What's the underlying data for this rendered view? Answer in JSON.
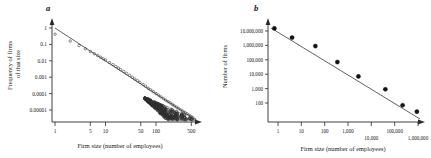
{
  "figure": {
    "panels": [
      {
        "letter": "a",
        "xlabel": "Firm size (number of employees)",
        "ylabel_line1": "Frequency of firms",
        "ylabel_line2": "of that size",
        "xticks": [
          "1",
          "5",
          "10",
          "50",
          "100",
          "500"
        ],
        "yticks": [
          "1",
          "0.1",
          "0.01",
          "0.001",
          "0.0001",
          "0.00001"
        ]
      },
      {
        "letter": "b",
        "xlabel": "Firm size (number of employees)",
        "ylabel": "Number of firms",
        "xticks": [
          "1",
          "10",
          "100",
          "1,000",
          "10,000",
          "100,000",
          "1,000,000"
        ],
        "yticks": [
          "10,000,000",
          "1,000,000",
          "100,000",
          "10,000",
          "1,000",
          "100"
        ]
      }
    ]
  },
  "chart_data": [
    {
      "type": "scatter",
      "title": "a",
      "xlabel": "Firm size (number of employees)",
      "ylabel": "Frequency of firms of that size",
      "xscale": "log",
      "yscale": "log",
      "xlim": [
        1,
        700
      ],
      "ylim": [
        1.5e-06,
        2
      ],
      "xticks": [
        1,
        5,
        10,
        50,
        100,
        500
      ],
      "xticklabels": [
        "1",
        "5",
        "10",
        "50",
        "100",
        "500"
      ],
      "yticks": [
        1,
        0.1,
        0.01,
        0.001,
        0.0001,
        1e-05
      ],
      "yticklabels": [
        "1",
        "0.1",
        "0.01",
        "0.001",
        "0.0001",
        "0.00001"
      ],
      "grid": false,
      "legend": null,
      "marker": "open-circle",
      "series": [
        {
          "name": "US firms by employee count",
          "x": [
            1,
            2,
            3,
            4,
            5,
            6,
            7,
            8,
            9,
            10,
            12,
            14,
            16,
            18,
            20,
            23,
            26,
            30,
            34,
            38,
            43,
            48,
            55,
            62,
            70,
            78,
            88,
            100,
            112,
            125,
            140,
            155,
            172,
            190,
            210,
            230,
            255,
            280,
            310,
            340,
            375,
            410,
            450,
            490,
            530
          ],
          "y": [
            0.42,
            0.16,
            0.085,
            0.054,
            0.037,
            0.027,
            0.021,
            0.0165,
            0.0133,
            0.011,
            0.0078,
            0.0058,
            0.0045,
            0.0036,
            0.0029,
            0.0022,
            0.0017,
            0.0013,
            0.00099,
            0.00078,
            0.00061,
            0.00048,
            0.00036,
            0.00028,
            0.00021,
            0.00017,
            0.00013,
            0.0001,
            8e-05,
            6.3e-05,
            5e-05,
            4e-05,
            3.3e-05,
            2.7e-05,
            2.2e-05,
            1.8e-05,
            1.5e-05,
            1.24e-05,
            1.01e-05,
            8.5e-06,
            7e-06,
            5.9e-06,
            4.9e-06,
            4.1e-06,
            3.5e-06
          ],
          "note": "Dense cloud of open circles; spread increases (fans out) above roughly 100 employees"
        }
      ],
      "fit": {
        "type": "power-law",
        "description": "straight line on log-log axes",
        "x": [
          1,
          600
        ],
        "y": [
          1.0,
          3.2e-06
        ]
      }
    },
    {
      "type": "scatter",
      "title": "b",
      "xlabel": "Firm size (number of employees)",
      "ylabel": "Number of firms",
      "xscale": "log",
      "yscale": "log",
      "xlim": [
        0.55,
        1400000
      ],
      "ylim": [
        15,
        30000000
      ],
      "xticks": [
        1,
        10,
        100,
        1000,
        10000,
        100000,
        1000000
      ],
      "xticklabels": [
        "1",
        "10",
        "100",
        "1,000",
        "10,000",
        "100,000",
        "1,000,000"
      ],
      "yticks": [
        10000000,
        1000000,
        100000,
        10000,
        1000,
        100
      ],
      "yticklabels": [
        "10,000,000",
        "1,000,000",
        "100,000",
        "10,000",
        "1,000",
        "100"
      ],
      "grid": false,
      "legend": null,
      "marker": "filled-circle",
      "series": [
        {
          "name": "Number of firms by size class",
          "x": [
            0.7,
            4,
            40,
            350,
            2800,
            40000,
            220000,
            900000
          ],
          "y": [
            15000000,
            3500000,
            900000,
            70000,
            7000,
            900,
            70,
            25
          ]
        }
      ],
      "fit": {
        "type": "power-law",
        "description": "straight line on log-log axes",
        "x": [
          0.62,
          1000000
        ],
        "y": [
          19000000,
          22
        ]
      }
    }
  ]
}
